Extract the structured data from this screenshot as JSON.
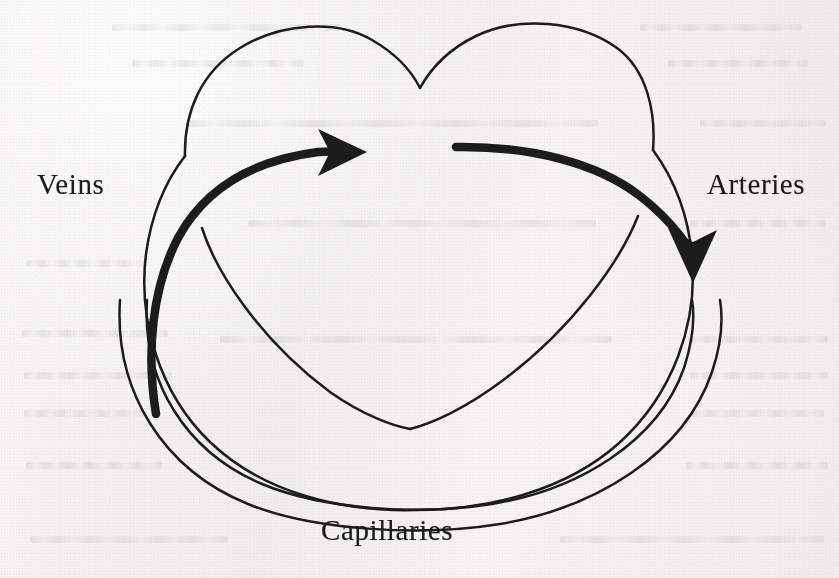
{
  "figure": {
    "background_color": "#f2f1ef",
    "ink_color": "#1a1a1a"
  },
  "labels": {
    "veins": "Veins",
    "arteries": "Arteries",
    "capillaries": "Capillaries"
  },
  "diagram": {
    "heart_outline_name": "heart-outline",
    "inner_chamber_name": "heart-inner-chevron",
    "capillary_loop_name": "capillary-loop",
    "flow_arrow_name": "blood-flow-arrow",
    "stroke_thin_px": 2.4,
    "stroke_thick_px": 8.5,
    "arrowhead_count": 2,
    "flow_direction": "veins-in-left, through-heart, arteries-out-right, around-capillaries"
  }
}
